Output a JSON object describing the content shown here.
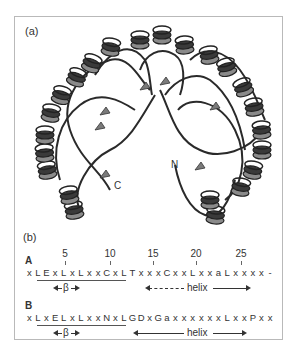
{
  "figure": {
    "panel_a_label": "(a)",
    "panel_b_label": "(b)",
    "structure": {
      "description": "horseshoe-shaped repeat protein ribbon diagram",
      "c_terminus_label": "C",
      "n_terminus_label": "N",
      "colors": {
        "helix_dark": "#3a3a3a",
        "helix_light": "#8a8a8a",
        "coil": "#2a2a2a",
        "strand": "#7a7a7a"
      }
    },
    "ruler": {
      "positions": [
        "5",
        "10",
        "15",
        "20",
        "25"
      ]
    },
    "sequences": [
      {
        "label": "A",
        "tokens": [
          "x",
          "L",
          "E",
          "x",
          "L",
          "x",
          "L",
          "x",
          "x",
          "C",
          "x",
          "L",
          "T",
          "x",
          "x",
          "x",
          "C",
          "x",
          "x",
          "L",
          "x",
          "x",
          "a",
          "L",
          "x",
          "x",
          "x",
          "x",
          "-"
        ],
        "underline_range": [
          1,
          11
        ],
        "beta_label": "β",
        "helix_label": "helix"
      },
      {
        "label": "B",
        "tokens": [
          "x",
          "L",
          "x",
          "E",
          "L",
          "x",
          "L",
          "x",
          "x",
          "N",
          "x",
          "L",
          "G",
          "D",
          "x",
          "G",
          "a",
          "x",
          "x",
          "x",
          "x",
          "x",
          "x",
          "L",
          "x",
          "x",
          "P",
          "x",
          "x"
        ],
        "underline_range": [
          1,
          11
        ],
        "beta_label": "β",
        "helix_label": "helix"
      }
    ]
  }
}
